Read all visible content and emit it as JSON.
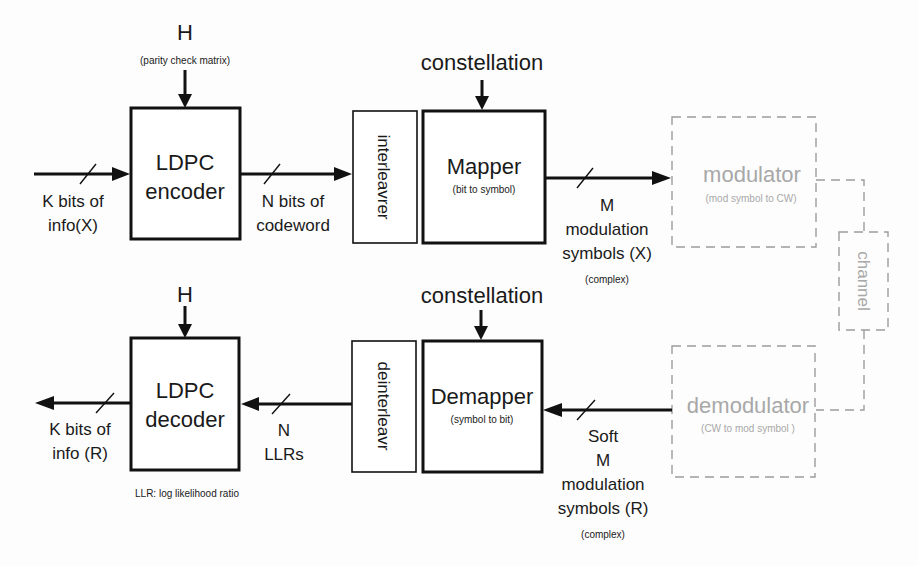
{
  "diagram": {
    "tx": {
      "h_label": "H",
      "h_sub": "(parity check matrix)",
      "encoder": {
        "line1": "LDPC",
        "line2": "encoder"
      },
      "input": {
        "line1": "K bits of",
        "line2": "info(X)"
      },
      "codeword": {
        "line1": "N bits of",
        "line2": "codeword"
      },
      "interleaver": "interleavrer",
      "constellation": "constellation",
      "mapper": {
        "title": "Mapper",
        "sub": "(bit to symbol)"
      },
      "symbols": {
        "line1": "M",
        "line2": "modulation",
        "line3": "symbols (X)",
        "note": "(complex)"
      },
      "modulator": {
        "title": "modulator",
        "sub": "(mod symbol to CW)"
      }
    },
    "channel": "channel",
    "rx": {
      "h_label": "H",
      "decoder": {
        "line1": "LDPC",
        "line2": "decoder"
      },
      "output": {
        "line1": "K bits of",
        "line2": "info (R)"
      },
      "llrs": {
        "line1": "N",
        "line2": "LLRs"
      },
      "llr_note": "LLR: log likelihood ratio",
      "deinterleaver": "deinterleavr",
      "constellation": "constellation",
      "demapper": {
        "title": "Demapper",
        "sub": "(symbol to bit)"
      },
      "symbols": {
        "line1": "Soft",
        "line2": "M",
        "line3": "modulation",
        "line4": "symbols (R)",
        "note": "(complex)"
      },
      "demodulator": {
        "title": "demodulator",
        "sub": "(CW to mod symbol )"
      }
    }
  }
}
